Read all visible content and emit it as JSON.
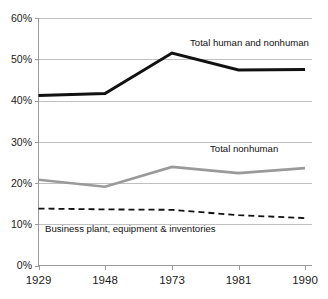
{
  "chart_data": {
    "type": "line",
    "title": "",
    "xlabel": "",
    "ylabel": "",
    "categories": [
      "1929",
      "1948",
      "1973",
      "1981",
      "1990"
    ],
    "x_tick_labels": [
      "1929",
      "1948",
      "1973",
      "1981",
      "1990"
    ],
    "y_tick_labels": [
      "60%",
      "50%",
      "40%",
      "30%",
      "20%",
      "10%",
      "0%"
    ],
    "y_tick_values": [
      60,
      50,
      40,
      30,
      20,
      10,
      0
    ],
    "ylim": [
      0,
      60
    ],
    "grid": "horizontal",
    "legend_position": "inline-annotations",
    "series": [
      {
        "name": "Total human and nonhuman",
        "label": "Total human and nonhuman",
        "color": "#111111",
        "style": "solid",
        "width": 3.0,
        "values": [
          41.2,
          41.7,
          51.5,
          47.4,
          47.5
        ]
      },
      {
        "name": "Total nonhuman",
        "label": "Total nonhuman",
        "color": "#9a9a9a",
        "style": "solid",
        "width": 2.6,
        "values": [
          20.8,
          19.1,
          23.9,
          22.4,
          23.6
        ]
      },
      {
        "name": "Business plant, equipment & inventories",
        "label": "Business plant, equipment & inventories",
        "color": "#111111",
        "style": "dashed",
        "width": 1.8,
        "values": [
          13.8,
          13.6,
          13.5,
          12.2,
          11.5
        ]
      }
    ],
    "annotations": [
      {
        "text": "Total human and nonhuman",
        "x": 190,
        "y": 46
      },
      {
        "text": "Total nonhuman",
        "x": 210,
        "y": 152
      },
      {
        "text": "Business plant, equipment & inventories",
        "x": 45,
        "y": 232
      }
    ]
  },
  "axis": {
    "y_labels": [
      "60%",
      "50%",
      "40%",
      "30%",
      "20%",
      "10%",
      "0%"
    ],
    "x_labels": [
      "1929",
      "1948",
      "1973",
      "1981",
      "1990"
    ]
  }
}
